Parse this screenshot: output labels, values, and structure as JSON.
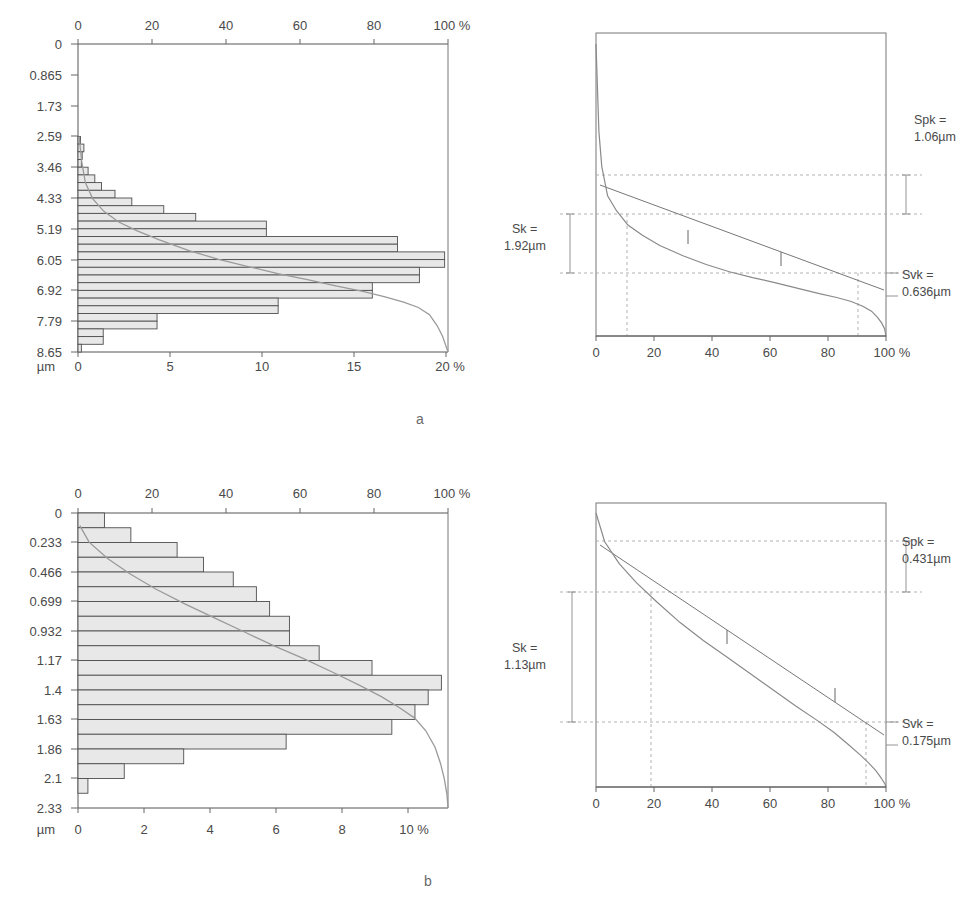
{
  "figure": {
    "sublabel_a": "a",
    "sublabel_b": "b"
  },
  "chart_data": [
    {
      "id": "hist-a",
      "type": "bar",
      "orientation": "horizontal",
      "title": "",
      "xlabel": "%",
      "ylabel": "µm",
      "unit_label": "µm",
      "percent_label": "%",
      "grid": false,
      "legend": "none",
      "top_axis": {
        "label": "%",
        "ticks": [
          "0",
          "20",
          "40",
          "60",
          "80",
          "100 %"
        ],
        "values": [
          0,
          20,
          40,
          60,
          80,
          100
        ],
        "range": [
          0,
          100
        ],
        "description": "Bearing area / material ratio (Abbott curve)"
      },
      "bottom_axis": {
        "label": "%",
        "ticks": [
          "0",
          "5",
          "10",
          "15",
          "20 %"
        ],
        "values": [
          0,
          5,
          10,
          15,
          20
        ],
        "range": [
          0,
          22
        ],
        "description": "Amplitude density (histogram percent)"
      },
      "yaxis": {
        "label": "µm",
        "ticks": [
          "0",
          "0.865",
          "1.73",
          "2.59",
          "3.46",
          "4.33",
          "5.19",
          "6.05",
          "6.92",
          "7.79",
          "8.65"
        ],
        "values": [
          0,
          0.865,
          1.73,
          2.59,
          3.46,
          4.33,
          5.19,
          6.05,
          6.92,
          7.79,
          8.65
        ],
        "range": [
          0,
          8.65
        ],
        "direction": "down"
      },
      "categories": [
        0.11,
        0.32,
        0.54,
        0.76,
        0.97,
        1.19,
        1.41,
        1.62,
        1.84,
        2.06,
        2.27,
        2.49,
        2.7,
        2.92,
        3.14,
        3.35,
        3.57,
        3.79,
        4.0,
        4.22,
        4.44,
        4.65,
        4.87,
        5.09,
        5.3,
        5.52,
        5.74,
        5.95,
        6.17,
        6.38,
        6.6,
        6.82,
        7.03,
        7.25,
        7.47,
        7.68,
        7.9,
        8.12,
        8.33,
        8.55
      ],
      "values": [
        0,
        0,
        0,
        0,
        0,
        0,
        0,
        0,
        0,
        0,
        0,
        0,
        0.15,
        0.35,
        0.25,
        0.2,
        0.6,
        1.0,
        1.4,
        2.2,
        3.2,
        5.1,
        7.0,
        11.2,
        11.2,
        19.0,
        19.0,
        21.8,
        21.8,
        20.3,
        20.3,
        17.5,
        17.5,
        11.9,
        11.9,
        4.7,
        4.7,
        1.5,
        1.5,
        0.2
      ],
      "curve": {
        "name": "Abbott-Firestone curve",
        "x_percent": [
          0.3,
          1,
          2,
          4,
          7,
          11,
          16,
          22,
          30,
          38,
          46,
          54,
          62,
          70,
          77,
          83,
          88,
          92,
          95,
          97,
          98.5,
          99.5,
          100
        ],
        "y_um": [
          2.6,
          3.3,
          3.9,
          4.35,
          4.7,
          5.0,
          5.25,
          5.5,
          5.8,
          6.05,
          6.25,
          6.45,
          6.62,
          6.8,
          6.95,
          7.1,
          7.25,
          7.4,
          7.6,
          7.9,
          8.2,
          8.5,
          8.65
        ]
      }
    },
    {
      "id": "abbott-a",
      "type": "line",
      "title": "",
      "xlabel": "%",
      "grid": false,
      "xaxis": {
        "ticks": [
          "0",
          "20",
          "40",
          "60",
          "80",
          "100 %"
        ],
        "values": [
          0,
          20,
          40,
          60,
          80,
          100
        ],
        "range": [
          0,
          100
        ]
      },
      "annotations": [
        {
          "name": "Spk",
          "line1": "Spk =",
          "line2": "1.06µm",
          "value": 1.06,
          "unit": "µm"
        },
        {
          "name": "Sk",
          "line1": "Sk =",
          "line2": "1.92µm",
          "value": 1.92,
          "unit": "µm"
        },
        {
          "name": "Svk",
          "line1": "Svk =",
          "line2": "0.636µm",
          "value": 0.636,
          "unit": "µm"
        }
      ],
      "mr1_percent": 11,
      "mr2_percent": 91,
      "curve": {
        "x_percent": [
          0,
          1,
          2,
          4,
          7,
          11,
          16,
          22,
          30,
          38,
          46,
          54,
          62,
          70,
          77,
          83,
          88,
          92,
          95,
          97,
          98.5,
          99.5,
          100
        ],
        "y_norm": [
          0.0,
          0.3,
          0.42,
          0.52,
          0.57,
          0.62,
          0.655,
          0.69,
          0.725,
          0.755,
          0.78,
          0.8,
          0.818,
          0.838,
          0.855,
          0.868,
          0.882,
          0.898,
          0.915,
          0.935,
          0.955,
          0.975,
          1.0
        ]
      }
    },
    {
      "id": "hist-b",
      "type": "bar",
      "orientation": "horizontal",
      "title": "",
      "xlabel": "%",
      "ylabel": "µm",
      "unit_label": "µm",
      "percent_label": "%",
      "grid": false,
      "legend": "none",
      "top_axis": {
        "label": "%",
        "ticks": [
          "0",
          "20",
          "40",
          "60",
          "80",
          "100 %"
        ],
        "values": [
          0,
          20,
          40,
          60,
          80,
          100
        ],
        "range": [
          0,
          100
        ],
        "description": "Bearing area / material ratio (Abbott curve)"
      },
      "bottom_axis": {
        "label": "%",
        "ticks": [
          "0",
          "2",
          "4",
          "6",
          "8",
          "10 %"
        ],
        "values": [
          0,
          2,
          4,
          6,
          8,
          10
        ],
        "range": [
          0,
          11.2
        ],
        "description": "Amplitude density (histogram percent)"
      },
      "yaxis": {
        "label": "µm",
        "ticks": [
          "0",
          "0.233",
          "0.466",
          "0.699",
          "0.932",
          "1.17",
          "1.4",
          "1.63",
          "1.86",
          "2.1",
          "2.33"
        ],
        "values": [
          0,
          0.233,
          0.466,
          0.699,
          0.932,
          1.17,
          1.4,
          1.63,
          1.86,
          2.1,
          2.33
        ],
        "range": [
          0,
          2.33
        ],
        "direction": "down"
      },
      "categories": [
        0.058,
        0.175,
        0.291,
        0.408,
        0.524,
        0.641,
        0.757,
        0.874,
        0.99,
        1.107,
        1.223,
        1.34,
        1.456,
        1.573,
        1.689,
        1.806,
        1.922,
        2.039,
        2.155,
        2.272
      ],
      "values": [
        0.8,
        0.8,
        1.6,
        1.6,
        3.0,
        3.0,
        3.8,
        3.8,
        4.7,
        4.7,
        5.4,
        5.4,
        5.8,
        5.8,
        6.4,
        6.4,
        6.4,
        6.4,
        7.3,
        7.3,
        8.9,
        8.9,
        11.0,
        11.0,
        10.6,
        10.6,
        10.2,
        10.2,
        9.5,
        9.5,
        6.3,
        6.3,
        3.2,
        3.2,
        1.4,
        1.4,
        0.3,
        0.3,
        0.0,
        0.0
      ],
      "bar_list": [
        0.8,
        1.6,
        3.0,
        3.8,
        4.7,
        5.4,
        5.8,
        6.4,
        6.4,
        7.3,
        8.9,
        11.0,
        10.6,
        10.2,
        9.5,
        6.3,
        3.2,
        1.4,
        0.3,
        0.0
      ],
      "curve": {
        "name": "Abbott-Firestone curve",
        "x_percent": [
          0.5,
          3,
          8,
          14,
          21,
          29,
          37,
          45,
          53,
          61,
          69,
          76,
          82,
          87,
          91,
          94,
          96.5,
          98,
          99,
          99.7,
          100
        ],
        "y_um": [
          0.1,
          0.23,
          0.36,
          0.48,
          0.6,
          0.72,
          0.83,
          0.94,
          1.05,
          1.15,
          1.26,
          1.36,
          1.45,
          1.54,
          1.62,
          1.72,
          1.85,
          1.98,
          2.1,
          2.22,
          2.33
        ]
      }
    },
    {
      "id": "abbott-b",
      "type": "line",
      "title": "",
      "xlabel": "%",
      "grid": false,
      "xaxis": {
        "ticks": [
          "0",
          "20",
          "40",
          "60",
          "80",
          "100 %"
        ],
        "values": [
          0,
          20,
          40,
          60,
          80,
          100
        ],
        "range": [
          0,
          100
        ]
      },
      "annotations": [
        {
          "name": "Spk",
          "line1": "Spk =",
          "line2": "0.431µm",
          "value": 0.431,
          "unit": "µm"
        },
        {
          "name": "Sk",
          "line1": "Sk =",
          "line2": "1.13µm",
          "value": 1.13,
          "unit": "µm"
        },
        {
          "name": "Svk",
          "line1": "Svk =",
          "line2": "0.175µm",
          "value": 0.175,
          "unit": "µm"
        }
      ],
      "mr1_percent": 19,
      "mr2_percent": 95,
      "curve": {
        "x_percent": [
          0,
          3,
          8,
          14,
          21,
          29,
          37,
          45,
          53,
          61,
          69,
          76,
          82,
          87,
          91,
          94,
          96.5,
          98,
          99,
          99.7,
          100
        ],
        "y_norm": [
          0.0,
          0.105,
          0.185,
          0.255,
          0.325,
          0.4,
          0.465,
          0.525,
          0.585,
          0.645,
          0.705,
          0.755,
          0.8,
          0.845,
          0.882,
          0.912,
          0.94,
          0.962,
          0.978,
          0.99,
          1.0
        ]
      }
    }
  ]
}
